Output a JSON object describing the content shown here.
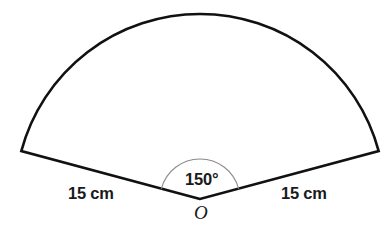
{
  "figure": {
    "kind": "circular-sector",
    "background_color": "#ffffff",
    "outline_color": "#111111",
    "angle_arc_color": "#8a8a8a",
    "labels": {
      "left_radius": "15 cm",
      "right_radius": "15 cm",
      "central_angle": "150°",
      "vertex": "O"
    },
    "geometry": {
      "vertex_x": 200,
      "vertex_y": 199,
      "radius_px": 185,
      "central_angle_deg": 150,
      "left_endpoint_x": 21,
      "left_endpoint_y": 151,
      "right_endpoint_x": 379,
      "right_endpoint_y": 151,
      "arc_apex_x": 200,
      "arc_apex_y": 14,
      "angle_arc_radius_px": 40,
      "outline_stroke_width": 2.6,
      "angle_arc_stroke_width": 1.1
    }
  }
}
